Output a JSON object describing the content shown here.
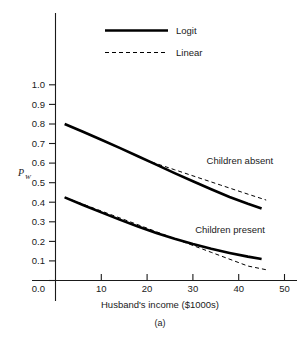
{
  "chart_data": {
    "type": "line",
    "title": "",
    "caption": "(a)",
    "xlabel": "Husband's income ($1000s)",
    "ylabel": "P",
    "ylabel_subscript": "W",
    "xlim": [
      0,
      52
    ],
    "ylim": [
      0.0,
      1.06
    ],
    "grid": false,
    "legend_position": "top-center",
    "xticks": [
      10,
      20,
      30,
      40,
      50
    ],
    "xtick_labels": [
      "10",
      "20",
      "30",
      "40",
      "50"
    ],
    "yticks": [
      0.0,
      0.1,
      0.2,
      0.3,
      0.4,
      0.5,
      0.6,
      0.7,
      0.8,
      0.9,
      1.0
    ],
    "ytick_labels": [
      "0.0",
      "0.1",
      "0.2",
      "0.3",
      "0.4",
      "0.5",
      "0.6",
      "0.7",
      "0.8",
      "0.9",
      "1.0"
    ],
    "legend": [
      {
        "name": "Logit",
        "style": "solid"
      },
      {
        "name": "Linear",
        "style": "dashed"
      }
    ],
    "annotations": [
      {
        "text": "Children absent",
        "x": 33,
        "y": 0.595
      },
      {
        "text": "Children present",
        "x": 30.5,
        "y": 0.245
      }
    ],
    "series": [
      {
        "name": "Logit - Children absent",
        "group": "Children absent",
        "style": "solid",
        "x": [
          2,
          6,
          10,
          14,
          18,
          22,
          26,
          30,
          34,
          38,
          42,
          45
        ],
        "y": [
          0.8,
          0.76,
          0.719,
          0.678,
          0.635,
          0.592,
          0.549,
          0.507,
          0.466,
          0.427,
          0.392,
          0.368
        ]
      },
      {
        "name": "Linear - Children absent",
        "group": "Children absent",
        "style": "dashed",
        "x": [
          21,
          26,
          31,
          36,
          41,
          46
        ],
        "y": [
          0.605,
          0.566,
          0.527,
          0.488,
          0.449,
          0.411
        ]
      },
      {
        "name": "Logit - Children present",
        "group": "Children present",
        "style": "solid",
        "x": [
          2,
          6,
          10,
          14,
          18,
          22,
          26,
          30,
          34,
          38,
          42,
          45
        ],
        "y": [
          0.425,
          0.386,
          0.348,
          0.311,
          0.276,
          0.243,
          0.213,
          0.186,
          0.162,
          0.141,
          0.122,
          0.11
        ]
      },
      {
        "name": "Linear - Children present",
        "group": "Children present",
        "style": "dashed",
        "x": [
          2,
          10,
          18,
          26,
          34,
          42,
          46
        ],
        "y": [
          0.425,
          0.355,
          0.285,
          0.214,
          0.144,
          0.074,
          0.055
        ]
      }
    ]
  },
  "labels": {
    "xlabel": "Husband's income ($1000s)",
    "caption": "(a)",
    "ylabel_p": "P",
    "ylabel_w": "W",
    "legend_logit": "Logit",
    "legend_linear": "Linear",
    "annot_absent": "Children absent",
    "annot_present": "Children present",
    "ytick_0": "0.0",
    "ytick_1": "0.1",
    "ytick_2": "0.2",
    "ytick_3": "0.3",
    "ytick_4": "0.4",
    "ytick_5": "0.5",
    "ytick_6": "0.6",
    "ytick_7": "0.7",
    "ytick_8": "0.8",
    "ytick_9": "0.9",
    "ytick_10": "1.0",
    "xtick_10": "10",
    "xtick_20": "20",
    "xtick_30": "30",
    "xtick_40": "40",
    "xtick_50": "50"
  },
  "colors": {
    "ink": "#1a1a1a",
    "line": "#000000",
    "background": "#ffffff"
  }
}
